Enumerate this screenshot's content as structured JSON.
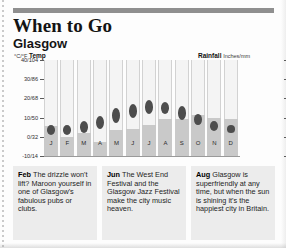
{
  "header": {
    "title": "When to Go",
    "subtitle": "Glasgow"
  },
  "chart_axes": {
    "temp_label_strong": "°C/°F",
    "temp_label_word": "Temp",
    "rain_label_strong": "Rainfall",
    "rain_label_unit": "Inches/mm"
  },
  "chart_data": {
    "type": "bar",
    "subtitle": "Glasgow",
    "xlabel": "",
    "ylabel": "°C/°F Temp",
    "y2label": "Rainfall Inches/mm",
    "grid": false,
    "legend": "none",
    "categories": [
      "J",
      "F",
      "M",
      "A",
      "M",
      "J",
      "J",
      "A",
      "S",
      "O",
      "N",
      "D"
    ],
    "left_axis": {
      "name": "Temp",
      "unit": "°C/°F",
      "ticks": [
        "40/104",
        "30/86",
        "20/68",
        "10/50",
        "0/32",
        "-10/14"
      ],
      "tick_values_c": [
        40,
        30,
        20,
        10,
        0,
        -10
      ],
      "ylim": [
        -10,
        40
      ]
    },
    "right_axis": {
      "name": "Rainfall",
      "unit": "Inches/mm",
      "ticks": [
        "10/250",
        "8/200",
        "6/150",
        "4/100",
        "2/50",
        "0"
      ],
      "tick_values_in": [
        10,
        8,
        6,
        4,
        2,
        0
      ],
      "ylim": [
        0,
        10
      ]
    },
    "series": [
      {
        "name": "Rainfall",
        "type": "bar",
        "unit": "inches",
        "axis": "right",
        "color": "#c9c9c9",
        "values": [
          3.1,
          2.0,
          2.4,
          1.5,
          2.7,
          2.8,
          3.2,
          3.9,
          3.9,
          4.3,
          4.0,
          3.9
        ]
      },
      {
        "name": "Temperature range",
        "type": "range-marker",
        "unit": "°C",
        "axis": "left",
        "color": "#4d4d4d",
        "low": [
          1,
          1,
          2,
          4,
          7,
          10,
          12,
          12,
          9,
          6,
          3,
          2
        ],
        "high": [
          6,
          6,
          8,
          11,
          15,
          17,
          19,
          18,
          16,
          12,
          8,
          6
        ]
      }
    ]
  },
  "tips": [
    {
      "month": "Feb",
      "text": "The drizzle won't lift? Maroon yourself in one of Glasgow's fabulous pubs or clubs."
    },
    {
      "month": "Jun",
      "text": "The West End Festival and the Glasgow Jazz Festival make the city music heaven."
    },
    {
      "month": "Aug",
      "text": "Glasgow is superfriendly at any time, but when the sun is shining it's the happiest city in Britain."
    }
  ]
}
